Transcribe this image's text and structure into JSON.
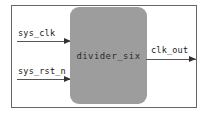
{
  "diagram": {
    "module": {
      "name": "divider_six",
      "fill_color": "#9d9d9d",
      "border_color": "#666666"
    },
    "inputs": [
      {
        "name": "sys_clk",
        "direction": "in",
        "arrow": "arrow-right"
      },
      {
        "name": "sys_rst_n",
        "direction": "in",
        "arrow": "arrow-right"
      }
    ],
    "outputs": [
      {
        "name": "clk_out",
        "direction": "out",
        "arrow": "arrow-right"
      }
    ]
  }
}
